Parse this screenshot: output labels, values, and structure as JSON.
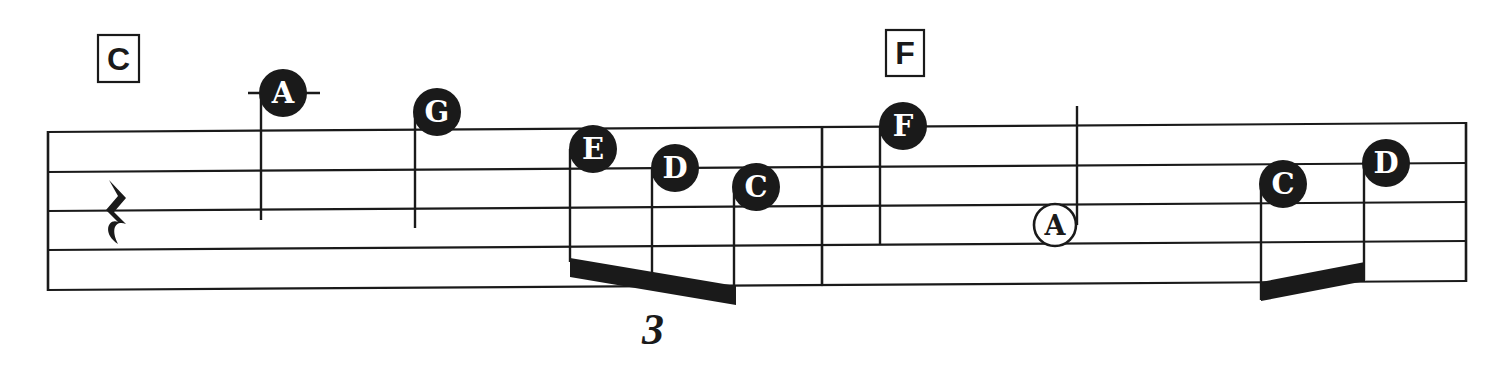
{
  "colors": {
    "ink": "#1a1a1a",
    "paper": "#ffffff",
    "note_text": "#ffffff"
  },
  "staff": {
    "x_start": 48,
    "x_end": 1466,
    "left_lines_y": [
      132,
      172,
      211,
      250,
      290
    ],
    "right_lines_y": [
      123,
      163,
      202,
      241,
      281
    ],
    "barlines_x": [
      48,
      822,
      1466
    ]
  },
  "measures": [
    {
      "chord": "C",
      "chord_box": {
        "x": 98,
        "y": 35,
        "w": 41,
        "h": 47
      },
      "rest": {
        "type": "quarter-rest",
        "x": 116,
        "y": 210
      },
      "notes": [
        {
          "letter": "A",
          "x": 283,
          "y": 93,
          "filled": true,
          "stem_x": 261,
          "stem_top": 93,
          "stem_bottom": 220,
          "ledger": [
            248,
            320
          ]
        },
        {
          "letter": "G",
          "x": 437,
          "y": 112,
          "filled": true,
          "stem_x": 415,
          "stem_top": 112,
          "stem_bottom": 228
        },
        {
          "letter": "E",
          "x": 593,
          "y": 149,
          "filled": true,
          "stem_x": 570,
          "stem_top": 149,
          "stem_bottom": 262
        },
        {
          "letter": "D",
          "x": 675,
          "y": 168,
          "filled": true,
          "stem_x": 652,
          "stem_top": 168,
          "stem_bottom": 282
        },
        {
          "letter": "C",
          "x": 756,
          "y": 187,
          "filled": true,
          "stem_x": 734,
          "stem_top": 187,
          "stem_bottom": 300
        }
      ],
      "beams": [
        {
          "x1": 570,
          "y1_top": 258,
          "x2": 736,
          "y2_top": 286,
          "thickness": 19
        }
      ],
      "tuplet": {
        "label": "3",
        "x": 653,
        "y": 344
      }
    },
    {
      "chord": "F",
      "chord_box": {
        "x": 886,
        "y": 30,
        "w": 38,
        "h": 46
      },
      "notes": [
        {
          "letter": "F",
          "x": 903,
          "y": 126,
          "filled": true,
          "stem_x": 880,
          "stem_top": 126,
          "stem_bottom": 245
        },
        {
          "letter": "A",
          "x": 1055,
          "y": 225,
          "filled": false,
          "stem_x": 1077,
          "stem_top": 106,
          "stem_bottom": 225
        },
        {
          "letter": "C",
          "x": 1283,
          "y": 184,
          "filled": true,
          "stem_x": 1261,
          "stem_top": 184,
          "stem_bottom": 300
        },
        {
          "letter": "D",
          "x": 1386,
          "y": 163,
          "filled": true,
          "stem_x": 1364,
          "stem_top": 163,
          "stem_bottom": 280
        }
      ],
      "beams": [
        {
          "x1": 1261,
          "y1_top": 282,
          "x2": 1365,
          "y2_top": 262,
          "thickness": 19
        }
      ]
    }
  ]
}
